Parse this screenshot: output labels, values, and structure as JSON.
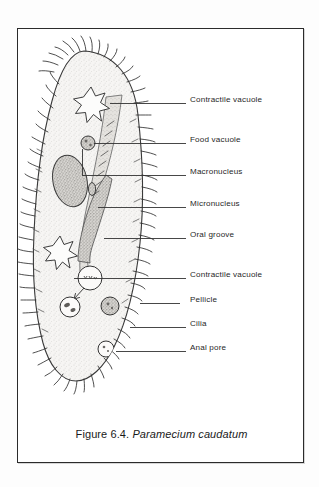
{
  "figure": {
    "caption_prefix": "Figure 6.4.",
    "caption_species": "Paramecium caudatum",
    "subject": "Paramecium caudatum",
    "frame_color": "#2b2b2b",
    "background_color": "#ffffff",
    "ink_color": "#1f1f1f",
    "cytoplasm_fill": "#f2f1ef",
    "organelle_fill": "#cfcdc9"
  },
  "callouts": [
    {
      "id": "contractile-vacuole-anterior",
      "label": "Contractile vacuole",
      "text_x": 172,
      "text_y": 71,
      "line_x1": 92,
      "line_y1": 74,
      "line_x2": 168,
      "line_y2": 74
    },
    {
      "id": "food-vacuole",
      "label": "Food vacuole",
      "text_x": 172,
      "text_y": 111,
      "line_x1": 76,
      "line_y1": 114,
      "line_x2": 168,
      "line_y2": 114
    },
    {
      "id": "macronucleus",
      "label": "Macronucleus",
      "text_x": 172,
      "text_y": 143,
      "line_x1": 64,
      "line_y1": 118,
      "line_x2": 168,
      "line_y2": 146
    },
    {
      "id": "micronucleus",
      "label": "Micronucleus",
      "text_x": 172,
      "text_y": 175,
      "line_x1": 83,
      "line_y1": 178,
      "line_x2": 168,
      "line_y2": 178
    },
    {
      "id": "oral-groove",
      "label": "Oral groove",
      "text_x": 172,
      "text_y": 206,
      "line_x1": 90,
      "line_y1": 209,
      "line_x2": 168,
      "line_y2": 209
    },
    {
      "id": "contractile-vacuole-posterior",
      "label": "Contractile vacuole",
      "text_x": 172,
      "text_y": 246,
      "line_x1": 72,
      "line_y1": 249,
      "line_x2": 168,
      "line_y2": 249
    },
    {
      "id": "pellicle",
      "label": "Pellicle",
      "text_x": 172,
      "text_y": 271,
      "line_x1": 118,
      "line_y1": 274,
      "line_x2": 162,
      "line_y2": 274
    },
    {
      "id": "cilia",
      "label": "Cilia",
      "text_x": 172,
      "text_y": 295,
      "line_x1": 110,
      "line_y1": 298,
      "line_x2": 168,
      "line_y2": 298
    },
    {
      "id": "anal-pore",
      "label": "Anal pore",
      "text_x": 172,
      "text_y": 319,
      "line_x1": 104,
      "line_y1": 322,
      "line_x2": 168,
      "line_y2": 322
    }
  ],
  "organelles": [
    {
      "id": "contractile-vacuole-anterior",
      "name": "contractile vacuole",
      "shape": "star",
      "cx": 73,
      "cy": 73,
      "r": 15
    },
    {
      "id": "food-vacuole-upper",
      "name": "food vacuole",
      "shape": "circle",
      "cx": 70,
      "cy": 114,
      "r": 7
    },
    {
      "id": "macronucleus",
      "name": "macronucleus",
      "shape": "oval",
      "cx": 52,
      "cy": 152,
      "rx": 17,
      "ry": 26
    },
    {
      "id": "micronucleus",
      "name": "micronucleus",
      "shape": "dot",
      "cx": 74,
      "cy": 160,
      "rx": 3.5,
      "ry": 6
    },
    {
      "id": "contractile-vacuole-posterior",
      "name": "contractile vacuole",
      "shape": "star",
      "cx": 42,
      "cy": 221,
      "r": 14
    },
    {
      "id": "gullet-vacuole",
      "name": "gullet vacuole",
      "shape": "circle",
      "cx": 72,
      "cy": 249,
      "r": 12
    },
    {
      "id": "food-vacuole-left",
      "name": "food vacuole",
      "shape": "circle",
      "cx": 52,
      "cy": 278,
      "r": 10
    },
    {
      "id": "food-vacuole-right",
      "name": "food vacuole",
      "shape": "circle",
      "cx": 92,
      "cy": 277,
      "r": 9
    },
    {
      "id": "anal-pore",
      "name": "anal pore",
      "shape": "circle",
      "cx": 88,
      "cy": 320,
      "r": 8
    }
  ]
}
